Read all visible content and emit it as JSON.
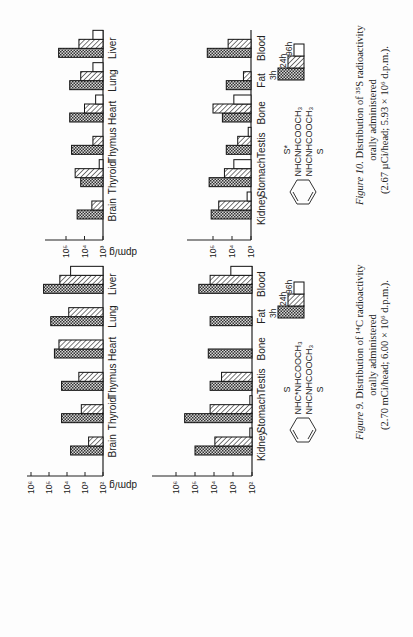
{
  "page": {
    "orientation": "rotated-90-ccw",
    "ylabel_text": "dpm/g"
  },
  "legend": {
    "items": [
      {
        "label": "3h",
        "pattern": "crosshatch"
      },
      {
        "label": "24h",
        "pattern": "diagonal"
      },
      {
        "label": "96h",
        "pattern": "open"
      }
    ]
  },
  "figures": [
    {
      "id": "figure-10",
      "caption": {
        "fig_label": "Figure 10.",
        "line1_rest": "Distribution of ³⁵S radioactivity",
        "line2": "orally administered",
        "line3": "(2.67 µCi/head; 5.93 × 10⁶ d.p.m.)."
      },
      "structure": {
        "top_group": "S*",
        "top_chain": "NHCNHCOOCH₃",
        "bottom_chain": "NHCNHCOOCH₃",
        "bottom_group": "S"
      }
    },
    {
      "id": "figure-9",
      "caption": {
        "fig_label": "Figure 9.",
        "line1_rest": "Distribution of ¹⁴C radioactivity",
        "line2": "orally administered",
        "line3": "(2.70 mCi/head; 6.00 × 10⁶ d.p.m.)."
      },
      "structure": {
        "top_group": "S",
        "top_chain": "NHC*NHCOOCH₃",
        "bottom_chain": "NHCNHCOOCH₃",
        "bottom_group": "S"
      }
    }
  ],
  "chart_data": [
    {
      "figure": "Figure 10",
      "panel": "upper",
      "type": "bar",
      "orientation": "horizontal-log",
      "title": "Distribution of 35S radioactivity orally administered",
      "xlabel": "",
      "ylabel": "dpm/g",
      "scale": "log10",
      "ylim": [
        1000,
        300000
      ],
      "tick_labels": [
        "10³",
        "10⁴",
        "10⁵"
      ],
      "tick_exponents": [
        3,
        4,
        5
      ],
      "categories": [
        "Brain",
        "Thyroid",
        "Thymus",
        "Heart",
        "Lung",
        "Liver"
      ],
      "series": [
        {
          "name": "3h",
          "values": [
            25000,
            16000,
            50000,
            63000,
            63000,
            250000
          ]
        },
        {
          "name": "24h",
          "values": [
            4000,
            32000,
            3500,
            10000,
            16000,
            20000
          ]
        },
        {
          "name": "96h",
          "values": [
            null,
            1600,
            null,
            2500,
            3500,
            3500
          ]
        }
      ]
    },
    {
      "figure": "Figure 10",
      "panel": "lower",
      "type": "bar",
      "orientation": "horizontal-log",
      "title": "Distribution of 35S radioactivity orally administered",
      "xlabel": "",
      "ylabel": "dpm/g",
      "scale": "log10",
      "ylim": [
        1000,
        300000
      ],
      "tick_labels": [
        "10³",
        "10⁴",
        "10⁵"
      ],
      "tick_exponents": [
        3,
        4,
        5
      ],
      "categories": [
        "Kidney",
        "Stomach",
        "Testis",
        "Bone",
        "Fat",
        "Blood"
      ],
      "series": [
        {
          "name": "3h",
          "values": [
            125000,
            160000,
            20000,
            32000,
            20000,
            200000
          ]
        },
        {
          "name": "24h",
          "values": [
            50000,
            25000,
            5000,
            100000,
            2500,
            16000
          ]
        },
        {
          "name": "96h",
          "values": [
            1600,
            8000,
            1400,
            8000,
            null,
            null
          ]
        }
      ]
    },
    {
      "figure": "Figure 9",
      "panel": "upper",
      "type": "bar",
      "orientation": "horizontal-log",
      "title": "Distribution of 14C radioactivity orally administered",
      "xlabel": "",
      "ylabel": "dpm/g",
      "scale": "log10",
      "ylim": [
        100,
        1000000
      ],
      "tick_labels": [
        "10²",
        "10³",
        "10⁴",
        "10⁵",
        "10⁶"
      ],
      "tick_exponents": [
        2,
        3,
        4,
        5,
        6
      ],
      "categories": [
        "Brain",
        "Thyroid",
        "Thymus",
        "Heart",
        "Lung",
        "Liver"
      ],
      "series": [
        {
          "name": "3h",
          "values": [
            6300,
            20000,
            20000,
            50000,
            80000,
            200000
          ]
        },
        {
          "name": "24h",
          "values": [
            630,
            1600,
            2200,
            28000,
            8000,
            25000
          ]
        },
        {
          "name": "96h",
          "values": [
            null,
            null,
            null,
            null,
            null,
            6300
          ]
        }
      ]
    },
    {
      "figure": "Figure 9",
      "panel": "lower",
      "type": "bar",
      "orientation": "horizontal-log",
      "title": "Distribution of 14C radioactivity orally administered",
      "xlabel": "",
      "ylabel": "dpm/g",
      "scale": "log10",
      "ylim": [
        100,
        1000000
      ],
      "tick_labels": [
        "10²",
        "10³",
        "10⁴",
        "10⁵",
        "10⁶"
      ],
      "tick_exponents": [
        2,
        3,
        4,
        5,
        6
      ],
      "categories": [
        "Kidney",
        "Stomach",
        "Testis",
        "Bone",
        "Fat",
        "Blood"
      ],
      "series": [
        {
          "name": "3h",
          "values": [
            100000,
            350000,
            16000,
            20000,
            16000,
            63000
          ]
        },
        {
          "name": "24h",
          "values": [
            9000,
            16000,
            4000,
            null,
            null,
            16000
          ]
        },
        {
          "name": "96h",
          "values": [
            130,
            130,
            null,
            null,
            null,
            1300
          ]
        }
      ]
    }
  ]
}
